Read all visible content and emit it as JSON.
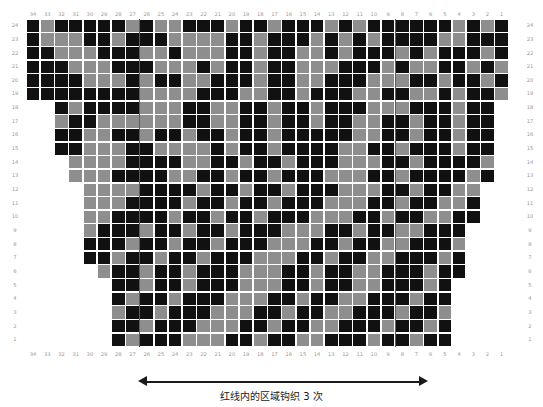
{
  "title": "",
  "chart_data": {
    "type": "heatmap",
    "title": "",
    "xlabel": "",
    "ylabel": "",
    "columns": 34,
    "rows": 24,
    "cell_width": 14.2,
    "cell_height": 13.65,
    "colors": {
      "dark": "#111111",
      "light": "#8e8e8e",
      "grid": "#ffffff",
      "page": "#ffffff"
    },
    "color_legend": [
      {
        "key": "1",
        "hex": "#111111",
        "name": "dark"
      },
      {
        "key": "0",
        "hex": "#8e8e8e",
        "name": "light"
      }
    ],
    "col_labels_top": [
      34,
      33,
      32,
      31,
      30,
      29,
      28,
      27,
      26,
      25,
      24,
      23,
      22,
      21,
      20,
      19,
      18,
      17,
      16,
      15,
      14,
      13,
      12,
      11,
      10,
      9,
      8,
      7,
      6,
      5,
      4,
      3,
      2,
      1
    ],
    "col_labels_bottom": [
      34,
      33,
      32,
      31,
      30,
      29,
      28,
      27,
      26,
      25,
      24,
      23,
      22,
      21,
      20,
      19,
      18,
      17,
      16,
      15,
      14,
      13,
      12,
      11,
      10,
      9,
      8,
      7,
      6,
      5,
      4,
      3,
      2,
      1
    ],
    "row_labels_left": [
      24,
      23,
      22,
      21,
      20,
      19,
      18,
      17,
      16,
      15,
      14,
      13,
      12,
      11,
      10,
      9,
      8,
      7,
      6,
      5,
      4,
      3,
      2,
      1
    ],
    "row_labels_right": [
      24,
      23,
      22,
      21,
      20,
      19,
      18,
      17,
      16,
      15,
      14,
      13,
      12,
      11,
      10,
      9,
      8,
      7,
      6,
      5,
      4,
      3,
      2,
      1
    ],
    "row_extent": [
      {
        "row": 24,
        "start": 0,
        "end": 34
      },
      {
        "row": 23,
        "start": 0,
        "end": 34
      },
      {
        "row": 22,
        "start": 0,
        "end": 34
      },
      {
        "row": 21,
        "start": 0,
        "end": 34
      },
      {
        "row": 20,
        "start": 0,
        "end": 34
      },
      {
        "row": 19,
        "start": 0,
        "end": 34
      },
      {
        "row": 18,
        "start": 2,
        "end": 34
      },
      {
        "row": 17,
        "start": 2,
        "end": 34
      },
      {
        "row": 16,
        "start": 2,
        "end": 34
      },
      {
        "row": 15,
        "start": 2,
        "end": 34
      },
      {
        "row": 14,
        "start": 3,
        "end": 34
      },
      {
        "row": 13,
        "start": 3,
        "end": 34
      },
      {
        "row": 12,
        "start": 4,
        "end": 33
      },
      {
        "row": 11,
        "start": 4,
        "end": 33
      },
      {
        "row": 10,
        "start": 4,
        "end": 33
      },
      {
        "row": 9,
        "start": 4,
        "end": 32
      },
      {
        "row": 8,
        "start": 4,
        "end": 32
      },
      {
        "row": 7,
        "start": 4,
        "end": 32
      },
      {
        "row": 6,
        "start": 5,
        "end": 31
      },
      {
        "row": 5,
        "start": 6,
        "end": 31
      },
      {
        "row": 4,
        "start": 6,
        "end": 31
      },
      {
        "row": 3,
        "start": 6,
        "end": 30
      },
      {
        "row": 2,
        "start": 6,
        "end": 30
      },
      {
        "row": 1,
        "start": 6,
        "end": 30
      }
    ],
    "matrix": [
      "1011111010011101101110101111110101",
      "1000110111000011011101010111100111",
      "1100011100100011011001011101011101",
      "1110001110001011011000111010011010",
      "1111000101100111011001110001101101",
      "1111111100001110011011100110010110",
      "..1011110001100110110111000111011 ",
      "..0110000001100110110110011011011 ",
      "..1100110110110110111110011011011 ",
      "..1100011000010110111100110111011 ",
      "...000011110011011011100011011110",
      "...000111100110110111000110111101",
      "....0000111101101101110001101100.",
      "....0001111011011011100011011001.",
      "....0011110110110111000110110011.",
      "....011101101101110001101100111..",
      "....111011011011100011011001110..",
      "....110110110111000110110011101..",
      ".....01101101110001101100111011..",
      "......110110111000110110011101..",
      "......101101110001101100111011..",
      "......011011100011011001110110.",
      "......110111000110110011101101.",
      "......101110001101100111011011."
    ],
    "markers": [
      {
        "name": "left-repeat-line",
        "after_column_index": 8,
        "color": "#5e5e5e"
      },
      {
        "name": "right-repeat-line",
        "after_column_index": 26,
        "color": "#5e5e5e"
      }
    ]
  },
  "repeat_annotation": {
    "caption": "红线内的区域钩织 3 次",
    "arrow": "double-headed",
    "left_label": "",
    "right_label": ""
  }
}
